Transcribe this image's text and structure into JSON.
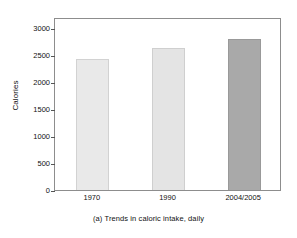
{
  "chart_data": {
    "type": "bar",
    "title": "",
    "caption": "(a) Trends in caloric intake, daily",
    "xlabel": "",
    "ylabel": "Calories",
    "categories": [
      "1970",
      "1990",
      "2004/2005"
    ],
    "values": [
      2430,
      2620,
      2790
    ],
    "ylim": [
      0,
      3200
    ],
    "yticks": [
      0,
      500,
      1000,
      1500,
      2000,
      2500,
      3000
    ],
    "ytick_labels": [
      "0",
      "500",
      "1000",
      "1500",
      "2000",
      "2500",
      "3000"
    ],
    "grid": false,
    "legend": "none",
    "bar_colors": [
      "#e9e9e9",
      "#e4e4e4",
      "#a9a9a9"
    ],
    "bar_edge_colors": [
      "#d2d2d2",
      "#cfcfcf",
      "#999999"
    ],
    "frame_color": "#8d8d8d",
    "background": "#ffffff"
  }
}
